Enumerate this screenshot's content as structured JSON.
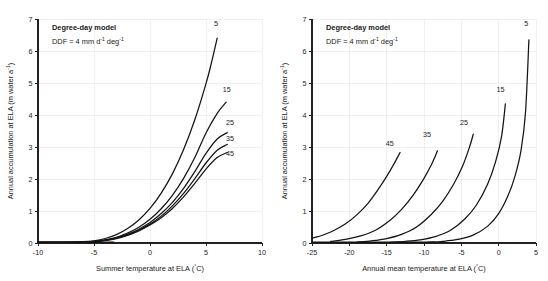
{
  "figure": {
    "title": "",
    "panels": [
      {
        "id": "left",
        "annotation_title": "Degree-day model",
        "annotation_sub_parts": {
          "lead": "DDF = 4 mm d",
          "sup1": "-1",
          "mid": " deg",
          "sup2": "-1"
        },
        "annotation_sub_text": "DDF = 4 mm d-1 deg-1",
        "xlabel_parts": {
          "lead": "Summer temperature at ELA (",
          "deg": "°",
          "tail": "C)"
        },
        "xlabel": "Summer temperature at ELA (°C)",
        "ylabel_parts": {
          "lead": "Annual accumulation at ELA (m water a",
          "sup": "-1",
          "tail": ")"
        },
        "ylabel": "Annual accumulation at ELA (m water a-1)"
      },
      {
        "id": "right",
        "annotation_title": "Degree-day model",
        "annotation_sub_parts": {
          "lead": "DDF = 4 mm d",
          "sup1": "-1",
          "mid": " deg",
          "sup2": "-1"
        },
        "annotation_sub_text": "DDF = 4 mm d-1 deg-1",
        "xlabel_parts": {
          "lead": "Annual mean temperature at ELA (",
          "deg": "°",
          "tail": "C)"
        },
        "xlabel": "Annual mean temperature at ELA (°C)",
        "ylabel_parts": {
          "lead": "Annual accumulation at ELA (m water a",
          "sup": "-1",
          "tail": ")"
        },
        "ylabel": "Annual accumulation at ELA (m water a-1)"
      }
    ]
  },
  "chart_data": [
    {
      "type": "line",
      "panel": "left",
      "title": "Degree-day model",
      "annotation": "DDF = 4 mm d-1 deg-1",
      "xlabel": "Summer temperature at ELA (°C)",
      "ylabel": "Annual accumulation at ELA (m water a-1)",
      "xlim": [
        -10,
        10
      ],
      "ylim": [
        0,
        7
      ],
      "xticks": [
        -10,
        -5,
        0,
        5,
        10
      ],
      "xticklabels": [
        "-10",
        "-5",
        "0",
        "5",
        "10"
      ],
      "yticks": [
        0,
        1,
        2,
        3,
        4,
        5,
        6,
        7
      ],
      "yticklabels": [
        "0",
        "1",
        "2",
        "3",
        "4",
        "5",
        "6",
        "7"
      ],
      "grid": true,
      "legend": "inline-curve-labels",
      "series": [
        {
          "name": "5",
          "label": "5",
          "label_x": 5.9,
          "label_y": 6.78,
          "x": [
            -10.0,
            -8.0,
            -6.0,
            -5.0,
            -4.0,
            -3.0,
            -2.0,
            -1.0,
            0.0,
            1.0,
            2.0,
            3.0,
            4.0,
            5.0,
            5.5,
            6.0
          ],
          "y": [
            0.02,
            0.02,
            0.04,
            0.07,
            0.14,
            0.26,
            0.45,
            0.72,
            1.08,
            1.56,
            2.16,
            2.92,
            3.85,
            4.98,
            5.65,
            6.4
          ]
        },
        {
          "name": "15",
          "label": "15",
          "label_x": 6.85,
          "label_y": 4.72,
          "x": [
            -10.0,
            -8.0,
            -6.0,
            -5.0,
            -4.0,
            -3.0,
            -2.0,
            -1.0,
            0.0,
            1.0,
            2.0,
            3.0,
            4.0,
            5.0,
            6.0,
            6.8
          ],
          "y": [
            0.02,
            0.02,
            0.03,
            0.05,
            0.1,
            0.18,
            0.31,
            0.49,
            0.74,
            1.07,
            1.49,
            2.02,
            2.67,
            3.44,
            4.05,
            4.4
          ]
        },
        {
          "name": "25",
          "label": "25",
          "label_x": 7.15,
          "label_y": 3.7,
          "x": [
            -10.0,
            -8.0,
            -6.0,
            -5.0,
            -4.0,
            -3.0,
            -2.0,
            -1.0,
            0.0,
            1.0,
            2.0,
            3.0,
            4.0,
            5.0,
            6.0,
            6.9
          ],
          "y": [
            0.02,
            0.02,
            0.03,
            0.05,
            0.09,
            0.16,
            0.27,
            0.43,
            0.64,
            0.92,
            1.27,
            1.71,
            2.23,
            2.8,
            3.25,
            3.45
          ]
        },
        {
          "name": "35",
          "label": "35",
          "label_x": 7.15,
          "label_y": 3.2,
          "x": [
            -10.0,
            -8.0,
            -6.0,
            -5.0,
            -4.0,
            -3.0,
            -2.0,
            -1.0,
            0.0,
            1.0,
            2.0,
            3.0,
            4.0,
            5.0,
            6.0,
            6.9
          ],
          "y": [
            0.02,
            0.02,
            0.03,
            0.04,
            0.08,
            0.15,
            0.25,
            0.4,
            0.59,
            0.84,
            1.16,
            1.55,
            2.01,
            2.5,
            2.9,
            3.08
          ]
        },
        {
          "name": "45",
          "label": "45",
          "label_x": 7.15,
          "label_y": 2.72,
          "x": [
            -10.0,
            -8.0,
            -6.0,
            -5.0,
            -4.0,
            -3.0,
            -2.0,
            -1.0,
            0.0,
            1.0,
            2.0,
            3.0,
            4.0,
            5.0,
            6.0,
            6.9
          ],
          "y": [
            0.02,
            0.02,
            0.03,
            0.04,
            0.08,
            0.14,
            0.24,
            0.38,
            0.56,
            0.79,
            1.08,
            1.44,
            1.86,
            2.31,
            2.67,
            2.83
          ]
        }
      ]
    },
    {
      "type": "line",
      "panel": "right",
      "title": "Degree-day model",
      "annotation": "DDF = 4 mm d-1 deg-1",
      "xlabel": "Annual mean temperature at ELA (°C)",
      "ylabel": "Annual accumulation at ELA (m water a-1)",
      "xlim": [
        -25,
        5
      ],
      "ylim": [
        0,
        7
      ],
      "xticks": [
        -25,
        -20,
        -15,
        -10,
        -5,
        0,
        5
      ],
      "xticklabels": [
        "-25",
        "-20",
        "-15",
        "-10",
        "-5",
        "0",
        "5"
      ],
      "yticks": [
        0,
        1,
        2,
        3,
        4,
        5,
        6,
        7
      ],
      "yticklabels": [
        "0",
        "1",
        "2",
        "3",
        "4",
        "5",
        "6",
        "7"
      ],
      "grid": true,
      "legend": "inline-curve-labels",
      "series": [
        {
          "name": "45",
          "label": "45",
          "label_x": -14.6,
          "label_y": 3.02,
          "x": [
            -25.0,
            -23.5,
            -22.0,
            -20.5,
            -19.0,
            -17.5,
            -16.0,
            -15.0,
            -14.0,
            -13.2
          ],
          "y": [
            0.15,
            0.25,
            0.4,
            0.6,
            0.88,
            1.24,
            1.72,
            2.08,
            2.48,
            2.83
          ]
        },
        {
          "name": "35",
          "label": "35",
          "label_x": -9.6,
          "label_y": 3.32,
          "x": [
            -22.5,
            -20.5,
            -18.5,
            -16.5,
            -14.5,
            -13.0,
            -11.5,
            -10.0,
            -9.0,
            -8.2
          ],
          "y": [
            0.05,
            0.11,
            0.22,
            0.4,
            0.72,
            1.05,
            1.48,
            2.02,
            2.45,
            2.88
          ]
        },
        {
          "name": "25",
          "label": "25",
          "label_x": -4.65,
          "label_y": 3.68,
          "x": [
            -19.0,
            -17.0,
            -15.0,
            -13.0,
            -11.0,
            -9.0,
            -7.5,
            -6.0,
            -4.8,
            -3.9,
            -3.4
          ],
          "y": [
            0.03,
            0.07,
            0.14,
            0.27,
            0.5,
            0.9,
            1.3,
            1.85,
            2.42,
            3.0,
            3.4
          ]
        },
        {
          "name": "15",
          "label": "15",
          "label_x": 0.25,
          "label_y": 4.72,
          "x": [
            -14.5,
            -12.5,
            -10.5,
            -8.5,
            -6.5,
            -4.5,
            -3.0,
            -1.5,
            -0.4,
            0.4,
            0.9
          ],
          "y": [
            0.02,
            0.05,
            0.1,
            0.2,
            0.39,
            0.76,
            1.18,
            1.83,
            2.55,
            3.35,
            4.35
          ]
        },
        {
          "name": "5",
          "label": "5",
          "label_x": 3.7,
          "label_y": 6.78,
          "x": [
            -9.5,
            -7.5,
            -5.5,
            -3.5,
            -1.5,
            0.0,
            1.2,
            2.2,
            3.0,
            3.6,
            4.05
          ],
          "y": [
            0.02,
            0.05,
            0.11,
            0.24,
            0.52,
            0.92,
            1.45,
            2.1,
            2.9,
            4.1,
            6.35
          ]
        }
      ]
    }
  ]
}
